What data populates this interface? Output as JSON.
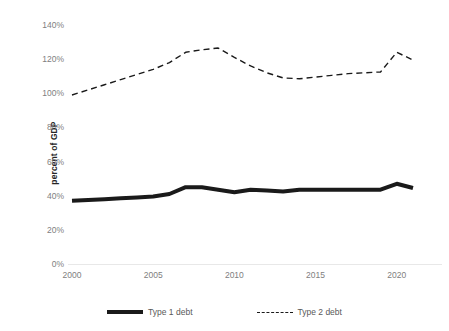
{
  "chart_data": {
    "type": "line",
    "title": "",
    "xlabel": "",
    "ylabel": "percent of GDP",
    "xlim": [
      2000,
      2021
    ],
    "ylim": [
      0,
      140
    ],
    "grid": false,
    "legend_position": "bottom",
    "x": [
      2000,
      2001,
      2002,
      2003,
      2004,
      2005,
      2006,
      2007,
      2008,
      2009,
      2010,
      2011,
      2012,
      2013,
      2014,
      2015,
      2016,
      2017,
      2018,
      2019,
      2020,
      2021
    ],
    "xticks": [
      2000,
      2005,
      2010,
      2015,
      2020
    ],
    "xtick_labels": [
      "2000",
      "2005",
      "2010",
      "2015",
      "2020"
    ],
    "yticks": [
      0,
      20,
      40,
      60,
      80,
      100,
      120,
      140
    ],
    "ytick_labels": [
      "0%",
      "20%",
      "40%",
      "60%",
      "80%",
      "100%",
      "120%",
      "140%"
    ],
    "series": [
      {
        "name": "Type 1 debt",
        "style": "solid",
        "color": "#1a1a1a",
        "linewidth": 4,
        "values": [
          37,
          37.5,
          38,
          38.5,
          39,
          39.5,
          41,
          45,
          45,
          43.5,
          42,
          43.5,
          43,
          42.5,
          43.5,
          43.5,
          43.5,
          43.5,
          43.5,
          43.5,
          47,
          44.5
        ]
      },
      {
        "name": "Type 2 debt",
        "style": "dashed",
        "color": "#1a1a1a",
        "linewidth": 1.4,
        "values": [
          99,
          102,
          105,
          108,
          111,
          114,
          118,
          124,
          125.5,
          126.5,
          121,
          116,
          112,
          109,
          108.5,
          109.5,
          110.5,
          111.5,
          112,
          112.5,
          124,
          119.5
        ]
      }
    ]
  },
  "legend": {
    "entries": [
      {
        "label": "Type 1 debt",
        "swatch": "solid-line-swatch"
      },
      {
        "label": "Type 2 debt",
        "swatch": "dashed-line-swatch"
      }
    ]
  }
}
